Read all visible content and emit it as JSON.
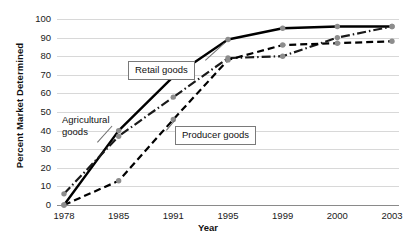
{
  "chart_data": {
    "type": "line",
    "title": "",
    "xlabel": "Year",
    "ylabel": "Percent Market Determined",
    "categories": [
      "1978",
      "1985",
      "1991",
      "1995",
      "1999",
      "2000",
      "2003"
    ],
    "ylim": [
      0,
      100
    ],
    "yticks": [
      0,
      10,
      20,
      30,
      40,
      50,
      60,
      70,
      80,
      90,
      100
    ],
    "grid": true,
    "legend": "annotations",
    "series": [
      {
        "name": "Retail goods",
        "style": "solid",
        "color": "#000000",
        "marker": "circle",
        "values": [
          0,
          40,
          69,
          89,
          95,
          96,
          96
        ]
      },
      {
        "name": "Agricultural goods",
        "style": "dash-dot",
        "color": "#1a1a1a",
        "marker": "circle",
        "values": [
          6,
          37,
          58,
          79,
          80,
          90,
          96
        ]
      },
      {
        "name": "Producer goods",
        "style": "dashed",
        "color": "#000000",
        "marker": "circle",
        "values": [
          0,
          13,
          46,
          78,
          86,
          87,
          88
        ]
      }
    ],
    "annotations": [
      {
        "id": "retail-goods",
        "label": "Retail goods",
        "boxed": true
      },
      {
        "id": "agricultural-goods",
        "label": "Agricultural\ngoods",
        "label_line1": "Agricultural",
        "label_line2": "goods",
        "boxed": false
      },
      {
        "id": "producer-goods",
        "label": "Producer goods",
        "boxed": true
      }
    ]
  }
}
